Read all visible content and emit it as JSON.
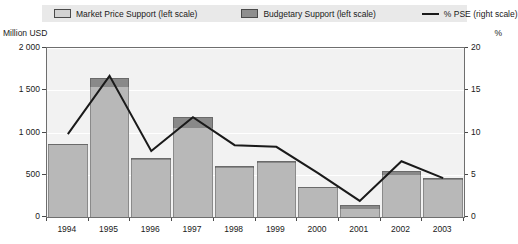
{
  "legend": {
    "items": [
      {
        "label": "Market Price Support (left scale)",
        "icon": "square-swatch-light",
        "color": "#d2d2d2"
      },
      {
        "label": "Budgetary Support (left scale)",
        "icon": "square-swatch-dark",
        "color": "#8e8e8e"
      },
      {
        "label": "% PSE (right scale)",
        "icon": "line-swatch",
        "color": "#1a1a1a"
      }
    ]
  },
  "axes": {
    "left_unit": "Million USD",
    "right_unit": "%",
    "left_ticks": [
      "0",
      "500",
      "1 000",
      "1 500",
      "2 000"
    ],
    "right_ticks": [
      "0",
      "5",
      "10",
      "15",
      "20"
    ]
  },
  "chart_data": {
    "type": "bar",
    "title": "",
    "subtitle": "",
    "xlabel": "",
    "ylabel": "Million USD",
    "y2label": "%",
    "categories": [
      "1994",
      "1995",
      "1996",
      "1997",
      "1998",
      "1999",
      "2000",
      "2001",
      "2002",
      "2003"
    ],
    "ylim": [
      0,
      2000
    ],
    "y2lim": [
      0,
      20
    ],
    "grid": true,
    "legend_position": "top",
    "stacked": true,
    "series": [
      {
        "name": "Market Price Support (left scale)",
        "type": "bar",
        "axis": "left",
        "color": "#b8b8b8",
        "values": [
          850,
          1540,
          680,
          1050,
          585,
          645,
          340,
          100,
          500,
          440
        ]
      },
      {
        "name": "Budgetary Support (left scale)",
        "type": "bar",
        "axis": "left",
        "color": "#898989",
        "values": [
          20,
          105,
          20,
          130,
          15,
          15,
          15,
          40,
          45,
          20
        ]
      },
      {
        "name": "% PSE (right scale)",
        "type": "line",
        "axis": "right",
        "color": "#1a1a1a",
        "values": [
          9.8,
          16.7,
          7.8,
          11.8,
          8.5,
          8.3,
          5.2,
          1.9,
          6.6,
          4.6
        ]
      }
    ]
  }
}
